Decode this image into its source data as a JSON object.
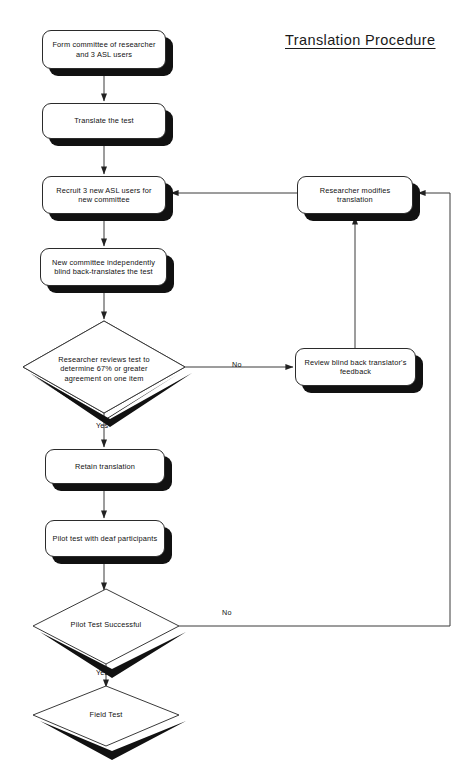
{
  "title": "Translation Procedure",
  "diagram": {
    "type": "flowchart",
    "orientation": "top-to-bottom",
    "nodes": [
      {
        "id": "form-committee",
        "shape": "process",
        "label": "Form committee of researcher and 3 ASL users",
        "line1": "Form committee of researcher",
        "line2": "and 3 ASL users",
        "x": 42,
        "y": 30,
        "w": 124,
        "h": 39
      },
      {
        "id": "translate-test",
        "shape": "process",
        "label": "Translate the test",
        "line1": "Translate the test",
        "line2": "",
        "x": 42,
        "y": 103,
        "w": 124,
        "h": 36
      },
      {
        "id": "recruit-users",
        "shape": "process",
        "label": "Recruit 3 new ASL users for new committee",
        "line1": "Recruit 3 new ASL users for",
        "line2": "new committee",
        "x": 42,
        "y": 176,
        "w": 124,
        "h": 38
      },
      {
        "id": "back-translate",
        "shape": "process",
        "label": "New committee independently blind back-translates the test",
        "line1": "New committee independently",
        "line2": "blind back-translates the test",
        "x": 40,
        "y": 248,
        "w": 127,
        "h": 38
      },
      {
        "id": "review-agreement",
        "shape": "decision",
        "label": "Researcher reviews test to determine 67% or greater agreement on one item",
        "line1": "Researcher reviews test to",
        "line2": "determine 67% or greater",
        "line3": "agreement on one item",
        "cx": 104,
        "cy": 367,
        "rx": 81,
        "ry": 46
      },
      {
        "id": "retain-translation",
        "shape": "process",
        "label": "Retain translation",
        "line1": "Retain translation",
        "line2": "",
        "x": 45,
        "y": 449,
        "w": 120,
        "h": 35
      },
      {
        "id": "pilot-test",
        "shape": "process",
        "label": "Pilot test with deaf participants",
        "line1": "Pilot test with deaf participants",
        "line2": "",
        "x": 45,
        "y": 520,
        "w": 120,
        "h": 37
      },
      {
        "id": "pilot-successful",
        "shape": "decision",
        "label": "Pilot Test Successful",
        "line1": "Pilot Test Successful",
        "line2": "",
        "line3": "",
        "cx": 106,
        "cy": 626,
        "rx": 73,
        "ry": 38
      },
      {
        "id": "field-test",
        "shape": "decision",
        "label": "Field Test",
        "line1": "Field Test",
        "line2": "",
        "line3": "",
        "cx": 106,
        "cy": 716,
        "rx": 73,
        "ry": 31
      },
      {
        "id": "researcher-modifies",
        "shape": "process",
        "label": "Researcher modifies translation",
        "line1": "Researcher modifies",
        "line2": "translation",
        "x": 297,
        "y": 176,
        "w": 116,
        "h": 38
      },
      {
        "id": "review-feedback",
        "shape": "process",
        "label": "Review blind back translator's feedback",
        "line1": "Review blind back translator's",
        "line2": "feedback",
        "x": 295,
        "y": 348,
        "w": 121,
        "h": 38
      }
    ],
    "edge_labels": [
      {
        "id": "no-agreement",
        "text": "No",
        "x": 232,
        "y": 360
      },
      {
        "id": "yes-agreement",
        "text": "Yes",
        "x": 96,
        "y": 421
      },
      {
        "id": "no-pilot",
        "text": "No",
        "x": 222,
        "y": 608
      },
      {
        "id": "yes-pilot",
        "text": "Yes",
        "x": 96,
        "y": 668
      }
    ]
  },
  "colors": {
    "background": "#ffffff",
    "line": "#3a3a3a",
    "shadow": "#111111",
    "text": "#111111",
    "node_fill": "#ffffff",
    "node_border": "#2b2b2b"
  }
}
